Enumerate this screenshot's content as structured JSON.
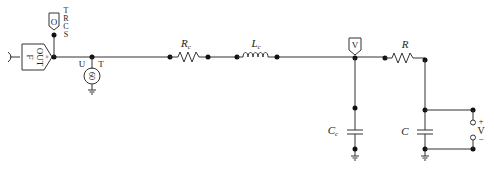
{
  "diagram": {
    "type": "circuit-schematic",
    "source_block": {
      "label_top": "F",
      "label_main": "OUT",
      "label_sub": "≡"
    },
    "probe_trcs": {
      "symbol": "O",
      "labels": [
        "T",
        "R",
        "C",
        "S"
      ]
    },
    "ac_source": {
      "symbol": "60",
      "label_left": "U",
      "label_right": "T"
    },
    "series_resistor": {
      "label": "R",
      "subscript": "c"
    },
    "series_inductor": {
      "label": "L",
      "subscript": "c"
    },
    "voltage_probe": {
      "symbol": "V"
    },
    "shunt_capacitor_c": {
      "label": "C",
      "subscript": "c"
    },
    "load_resistor": {
      "label": "R"
    },
    "load_capacitor": {
      "label": "C"
    },
    "voltmeter": {
      "plus": "+",
      "label": "V",
      "minus": "−"
    }
  }
}
